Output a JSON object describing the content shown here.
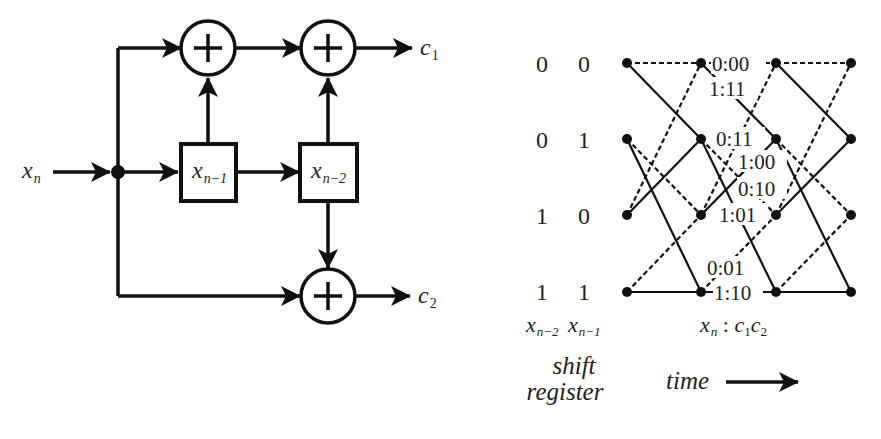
{
  "encoder": {
    "input_label": "x",
    "input_sub": "n",
    "reg1_label": "x",
    "reg1_sub": "n−1",
    "reg2_label": "x",
    "reg2_sub": "n−2",
    "out1_label": "c",
    "out1_sub": "1",
    "out2_label": "c",
    "out2_sub": "2",
    "adder_symbol": "+"
  },
  "trellis": {
    "states": [
      {
        "xn2": "0",
        "xn1": "0"
      },
      {
        "xn2": "0",
        "xn1": "1"
      },
      {
        "xn2": "1",
        "xn1": "0"
      },
      {
        "xn2": "1",
        "xn1": "1"
      }
    ],
    "branch_labels": [
      "0:00",
      "1:11",
      "0:11",
      "1:00",
      "0:10",
      "1:01",
      "0:01",
      "1:10"
    ],
    "legend": {
      "state_col1": "x",
      "state_col1_sub": "n−2",
      "state_col2": "x",
      "state_col2_sub": "n−1",
      "caption_line1": "shift",
      "caption_line2": "register",
      "branch_key_x": "x",
      "branch_key_x_sub": "n",
      "branch_key_sep": " : ",
      "branch_key_c1": "c",
      "branch_key_c1_sub": "1",
      "branch_key_c2": "c",
      "branch_key_c2_sub": "2",
      "time_label": "time"
    },
    "line_style_key": {
      "input_0": "dashed",
      "input_1": "solid"
    }
  }
}
